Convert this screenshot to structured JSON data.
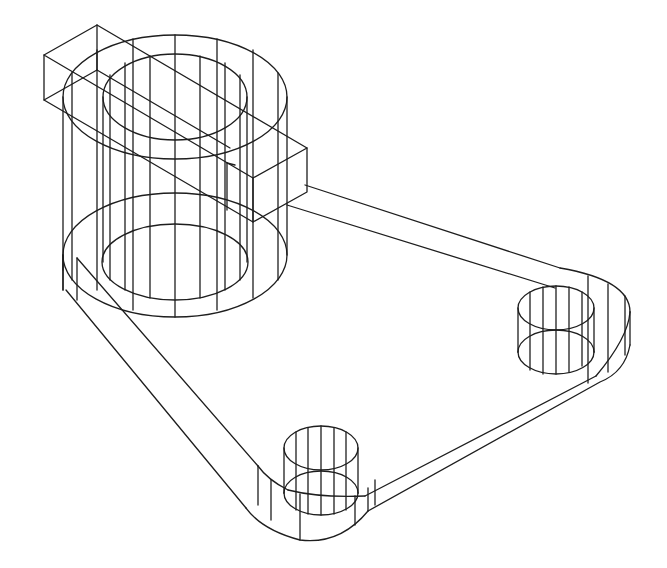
{
  "figure": {
    "type": "isometric-wireframe",
    "stroke_color": "#1e1e1e",
    "background": "#ffffff",
    "stroke_width": 1.3
  },
  "parts": {
    "main_boss": {
      "label": "cylindrical-boss"
    },
    "bore": {
      "label": "center-bore"
    },
    "key_block": {
      "label": "key-block"
    },
    "base_plate": {
      "label": "triangular-base-plate"
    },
    "hole_right": {
      "label": "mounting-hole-right"
    },
    "hole_bottom": {
      "label": "mounting-hole-bottom"
    }
  }
}
